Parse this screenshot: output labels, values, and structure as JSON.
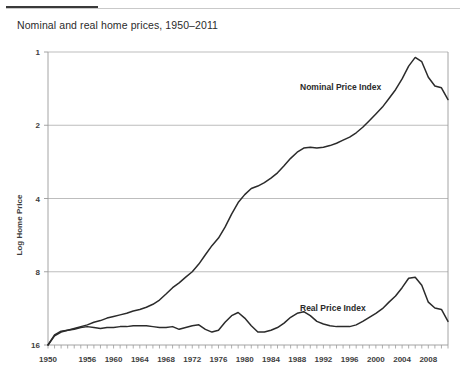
{
  "header": {
    "rule_color": "#3a3a3a",
    "rule_light_color": "#c9c9c9"
  },
  "chart_title": "Nominal and real home prices, 1950–2011",
  "axis": {
    "ylabel": "Log Home Price",
    "y_ticks": [
      "16",
      "8",
      "4",
      "2",
      "1"
    ],
    "x_ticks": [
      "1950",
      "1956",
      "1960",
      "1964",
      "1968",
      "1972",
      "1976",
      "1980",
      "1984",
      "1988",
      "1992",
      "1996",
      "2000",
      "2004",
      "2008"
    ]
  },
  "annotations": {
    "nominal": "Nominal Price Index",
    "real": "Real Price Index"
  },
  "chart_data": {
    "type": "line",
    "title": "Nominal and real home prices, 1950–2011",
    "xlabel": "",
    "ylabel": "Log Home Price",
    "y_scale": "log2",
    "ylim": [
      1,
      16
    ],
    "y_ticks": [
      1,
      2,
      4,
      8,
      16
    ],
    "xlim": [
      1950,
      2011
    ],
    "x_ticks": [
      1950,
      1956,
      1960,
      1964,
      1968,
      1972,
      1976,
      1980,
      1984,
      1988,
      1992,
      1996,
      2000,
      2004,
      2008
    ],
    "grid": "horizontal",
    "legend": "inline-annotations",
    "line_color": "#2b2b2b",
    "x": [
      1950,
      1951,
      1952,
      1953,
      1954,
      1955,
      1956,
      1957,
      1958,
      1959,
      1960,
      1961,
      1962,
      1963,
      1964,
      1965,
      1966,
      1967,
      1968,
      1969,
      1970,
      1971,
      1972,
      1973,
      1974,
      1975,
      1976,
      1977,
      1978,
      1979,
      1980,
      1981,
      1982,
      1983,
      1984,
      1985,
      1986,
      1987,
      1988,
      1989,
      1990,
      1991,
      1992,
      1993,
      1994,
      1995,
      1996,
      1997,
      1998,
      1999,
      2000,
      2001,
      2002,
      2003,
      2004,
      2005,
      2006,
      2007,
      2008,
      2009,
      2010,
      2011
    ],
    "series": [
      {
        "name": "Nominal Price Index",
        "values": [
          1.0,
          1.09,
          1.13,
          1.15,
          1.17,
          1.19,
          1.21,
          1.24,
          1.26,
          1.29,
          1.31,
          1.33,
          1.35,
          1.38,
          1.4,
          1.43,
          1.47,
          1.53,
          1.62,
          1.72,
          1.8,
          1.9,
          2.0,
          2.15,
          2.35,
          2.56,
          2.75,
          3.05,
          3.45,
          3.85,
          4.15,
          4.4,
          4.5,
          4.65,
          4.85,
          5.1,
          5.45,
          5.85,
          6.2,
          6.45,
          6.5,
          6.45,
          6.5,
          6.6,
          6.75,
          6.95,
          7.15,
          7.45,
          7.85,
          8.35,
          8.9,
          9.5,
          10.3,
          11.2,
          12.4,
          14.0,
          15.2,
          14.6,
          12.6,
          11.6,
          11.4,
          10.2
        ],
        "peak": {
          "year": 2006,
          "value": 15.2
        }
      },
      {
        "name": "Real Price Index",
        "values": [
          1.0,
          1.1,
          1.14,
          1.15,
          1.16,
          1.18,
          1.19,
          1.18,
          1.17,
          1.18,
          1.18,
          1.19,
          1.19,
          1.2,
          1.2,
          1.2,
          1.19,
          1.18,
          1.18,
          1.19,
          1.16,
          1.18,
          1.2,
          1.21,
          1.16,
          1.13,
          1.15,
          1.24,
          1.32,
          1.36,
          1.29,
          1.2,
          1.13,
          1.13,
          1.15,
          1.18,
          1.23,
          1.3,
          1.35,
          1.37,
          1.32,
          1.25,
          1.22,
          1.2,
          1.19,
          1.19,
          1.19,
          1.21,
          1.25,
          1.3,
          1.35,
          1.41,
          1.5,
          1.59,
          1.72,
          1.88,
          1.9,
          1.76,
          1.5,
          1.42,
          1.4,
          1.25
        ],
        "peak": {
          "year": 2006,
          "value": 1.9
        }
      }
    ]
  }
}
